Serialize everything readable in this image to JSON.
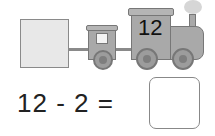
{
  "train": {
    "locomotive_number": "12"
  },
  "equation": {
    "text": "12 - 2 =",
    "answer": ""
  }
}
